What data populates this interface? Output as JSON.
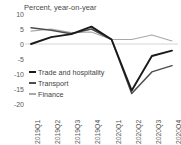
{
  "chart_data": {
    "type": "line",
    "title": "Percent, year-on-year",
    "xlabel": "",
    "ylabel": "",
    "ylim": [
      -20,
      10
    ],
    "yticks": [
      10,
      5,
      0,
      -5,
      -10,
      -15,
      -20
    ],
    "categories": [
      "2019Q1",
      "2019Q2",
      "2019Q3",
      "2019Q4",
      "2020Q1",
      "2020Q2",
      "2020Q3",
      "2020Q4"
    ],
    "grid": false,
    "zero_line": true,
    "legend_position": "inside-left",
    "series": [
      {
        "name": "Trade and hospitality",
        "color": "#1a1a1a",
        "width": 1.9,
        "values": [
          0.0,
          2.3,
          3.3,
          5.8,
          1.5,
          -15.5,
          -4.0,
          -2.2
        ]
      },
      {
        "name": "Transport",
        "color": "#4d4d4d",
        "width": 1.5,
        "values": [
          5.4,
          4.6,
          3.4,
          5.0,
          1.5,
          -16.5,
          -9.3,
          -7.2
        ]
      },
      {
        "name": "Finance",
        "color": "#a8a8a8",
        "width": 1.1,
        "values": [
          4.3,
          5.0,
          3.8,
          4.0,
          1.5,
          1.5,
          3.0,
          1.0
        ]
      }
    ]
  }
}
